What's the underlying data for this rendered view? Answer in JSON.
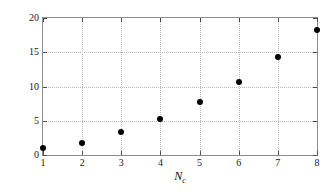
{
  "chart_data": {
    "type": "scatter",
    "title": "",
    "xlabel": "N_c",
    "xlabel_base": "N",
    "xlabel_sub": "c",
    "ylabel": "Ratio of no. of measurements",
    "x": [
      1,
      2,
      3,
      4,
      5,
      6,
      7,
      8
    ],
    "values": [
      1.0,
      1.7,
      3.4,
      5.3,
      7.8,
      10.7,
      14.3,
      18.3
    ],
    "series": [
      {
        "name": "Ratio of no. of measurements",
        "values": [
          1.0,
          1.7,
          3.4,
          5.3,
          7.8,
          10.7,
          14.3,
          18.3
        ]
      }
    ],
    "xlim": [
      1,
      8
    ],
    "ylim": [
      0,
      20
    ],
    "x_ticks": [
      1,
      2,
      3,
      4,
      5,
      6,
      7,
      8
    ],
    "x_tick_labels": [
      "1",
      "2",
      "3",
      "4",
      "5",
      "6",
      "7",
      "8"
    ],
    "y_ticks": [
      0,
      5,
      10,
      15,
      20
    ],
    "y_tick_labels": [
      "0",
      "5",
      "10",
      "15",
      "20"
    ],
    "grid": true,
    "grid_style": "dotted",
    "legend": "none",
    "marker": "filled-circle",
    "marker_color": "#000000",
    "frame_color": "#8c8c8c",
    "grid_color": "#b9b9b9",
    "background": "#ffffff"
  }
}
